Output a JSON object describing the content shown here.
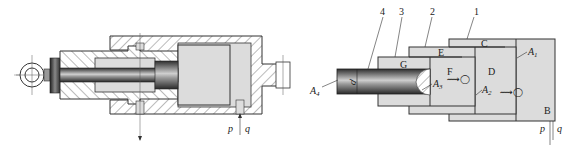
{
  "figure": {
    "left": {
      "title": "Telescopic cylinder sectional view",
      "port_labels": {
        "pressure": "p",
        "flow": "q"
      }
    },
    "right": {
      "title": "Telescopic cylinder schematic",
      "part_numbers": [
        "4",
        "3",
        "2",
        "1"
      ],
      "chamber_labels": {
        "B": "B",
        "C": "C",
        "D": "D",
        "E": "E",
        "F": "F",
        "G": "G"
      },
      "area_labels": {
        "A1": {
          "base": "A",
          "sub": "1"
        },
        "A2": {
          "base": "A",
          "sub": "2"
        },
        "A3": {
          "base": "A",
          "sub": "3"
        },
        "A4": {
          "base": "A",
          "sub": "4"
        }
      },
      "diameter_label": "d",
      "port_labels": {
        "pressure": "p",
        "flow": "q"
      }
    },
    "colors": {
      "line": "#333333",
      "fill_light": "#dcdcdc",
      "hatch": "#555555",
      "rod_dark": "#3a3a3a",
      "rod_light": "#bdbdbd"
    }
  }
}
